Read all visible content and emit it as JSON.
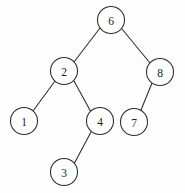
{
  "figure": {
    "width": 185,
    "height": 193,
    "background_color": "#fdfdfd",
    "stroke_color": "#2b2b2b",
    "node_fill_color": "#ffffff",
    "label_color": "#1d1d1d",
    "node_radius": 13.5
  },
  "nodes": [
    {
      "id": "n6",
      "label": "6",
      "cx": 111,
      "cy": 20
    },
    {
      "id": "n2",
      "label": "2",
      "cx": 64,
      "cy": 71
    },
    {
      "id": "n8",
      "label": "8",
      "cx": 160,
      "cy": 72
    },
    {
      "id": "n1",
      "label": "1",
      "cx": 24,
      "cy": 121
    },
    {
      "id": "n4",
      "label": "4",
      "cx": 100,
      "cy": 121
    },
    {
      "id": "n7",
      "label": "7",
      "cx": 134,
      "cy": 122
    },
    {
      "id": "n3",
      "label": "3",
      "cx": 64,
      "cy": 172
    }
  ],
  "edges": [
    {
      "id": "e6-2",
      "from": "n6",
      "to": "n2",
      "x1": 100,
      "y1": 28,
      "x2": 74,
      "y2": 62
    },
    {
      "id": "e6-8",
      "from": "n6",
      "to": "n8",
      "x1": 122,
      "y1": 29,
      "x2": 150,
      "y2": 63
    },
    {
      "id": "e2-1",
      "from": "n2",
      "to": "n1",
      "x1": 55,
      "y1": 81,
      "x2": 33,
      "y2": 111
    },
    {
      "id": "e2-4",
      "from": "n2",
      "to": "n4",
      "x1": 74,
      "y1": 81,
      "x2": 91,
      "y2": 112
    },
    {
      "id": "e8-7",
      "from": "n8",
      "to": "n7",
      "x1": 152,
      "y1": 83,
      "x2": 141,
      "y2": 110
    },
    {
      "id": "e4-3",
      "from": "n4",
      "to": "n3",
      "x1": 91,
      "y1": 132,
      "x2": 74,
      "y2": 164
    }
  ]
}
